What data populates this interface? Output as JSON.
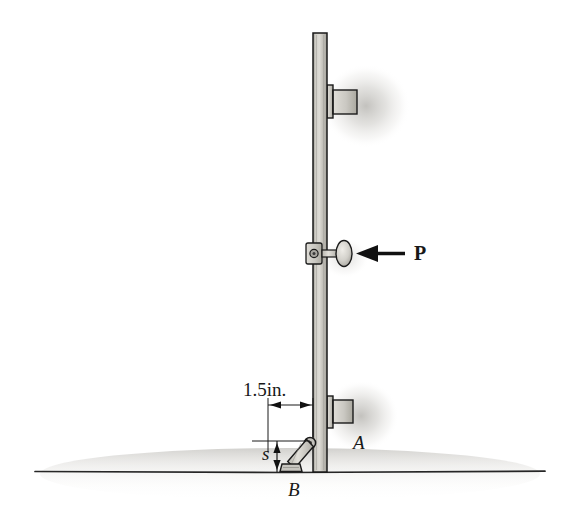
{
  "figure": {
    "background_color": "#ffffff",
    "width": 570,
    "height": 512
  },
  "labels": {
    "dimension_horizontal": "1.5in.",
    "dimension_vertical": "s",
    "point_a": "A",
    "point_b": "B",
    "force": "P"
  },
  "colors": {
    "outline": "#1a1a1a",
    "post_fill_light": "#d8d6d0",
    "post_fill_dark": "#a9a7a0",
    "bracket_fill": "#c9c7c1",
    "strut_fill": "#cfcdc7",
    "knob_fill": "#d5d3cd",
    "shadow": "#b0aea8",
    "ground_line": "#262626"
  },
  "geometry": {
    "post": {
      "x": 313,
      "y_top": 33,
      "width": 14,
      "y_bottom": 472
    },
    "bracket_top": {
      "x": 327,
      "y": 85,
      "width": 30,
      "height": 33
    },
    "bracket_bottom": {
      "x": 327,
      "y": 396,
      "width": 25,
      "height": 32
    },
    "knob": {
      "collar_y": 243,
      "shaft_end_x": 355,
      "arrow_tail_x": 405
    },
    "pin_a": {
      "x": 310,
      "y": 443
    },
    "base_b": {
      "x": 288,
      "y": 468
    },
    "ground": {
      "y": 472,
      "x_start": 35,
      "x_end": 545
    },
    "dimension_horizontal_extent": {
      "x_left": 268,
      "x_right": 313,
      "y": 405
    },
    "dimension_vertical_extent": {
      "x": 277,
      "y_top": 441,
      "y_bottom": 472
    }
  },
  "annotations": {
    "force_direction": "leftward",
    "force_arrow_label": "P",
    "support_at_ground": "B",
    "pin_joint": "A"
  }
}
